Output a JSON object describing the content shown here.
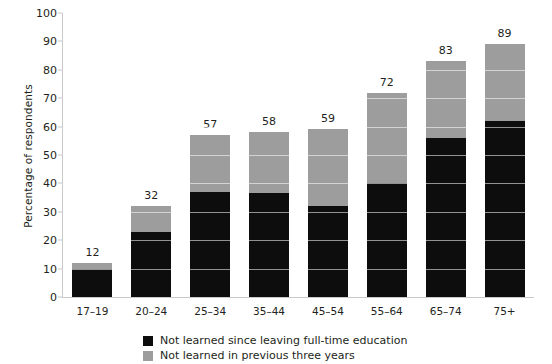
{
  "chart_data": {
    "type": "bar",
    "subtype": "stacked-bar",
    "title": "",
    "xlabel": "",
    "ylabel": "Percentage of respondents",
    "categories": [
      "17–19",
      "20–24",
      "25–34",
      "35–44",
      "45–54",
      "55–64",
      "65–74",
      "75+"
    ],
    "series": [
      {
        "name": "Not learned since leaving full-time education",
        "color": "#0d0d0d",
        "values": [
          10,
          23,
          37,
          36.5,
          32,
          40,
          56,
          62
        ]
      },
      {
        "name": "Not learned in previous three years",
        "color": "#9d9d9d",
        "values": [
          2,
          9,
          20,
          21.5,
          27,
          32,
          27,
          27
        ]
      }
    ],
    "totals": [
      12,
      32,
      57,
      58,
      59,
      72,
      83,
      89
    ],
    "data_labels": [
      "12",
      "32",
      "57",
      "58",
      "59",
      "72",
      "83",
      "89"
    ],
    "ylim": [
      0,
      100
    ],
    "yticks": [
      0,
      10,
      20,
      30,
      40,
      50,
      60,
      70,
      80,
      90,
      100
    ],
    "ytick_labels": [
      "0",
      "10",
      "20",
      "30",
      "40",
      "50",
      "60",
      "70",
      "80",
      "90",
      "100"
    ],
    "grid": true,
    "grid_axis": "y",
    "legend_position": "bottom-center"
  },
  "legend": {
    "items": [
      {
        "label": "Not learned since leaving full-time education",
        "color": "#0d0d0d"
      },
      {
        "label": "Not learned in previous three years",
        "color": "#9d9d9d"
      }
    ]
  }
}
